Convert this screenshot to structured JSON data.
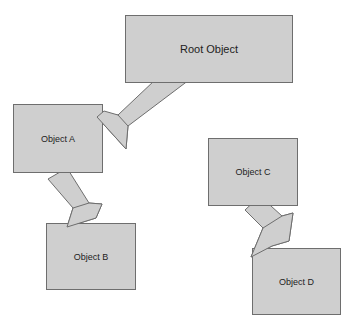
{
  "diagram": {
    "colors": {
      "fill": "#cfcfcf",
      "stroke": "#6e6e6e",
      "text": "#222222"
    },
    "nodes": [
      {
        "id": "root",
        "label": "Root Object"
      },
      {
        "id": "a",
        "label": "Object A"
      },
      {
        "id": "b",
        "label": "Object B"
      },
      {
        "id": "c",
        "label": "Object C"
      },
      {
        "id": "d",
        "label": "Object D"
      }
    ],
    "edges": [
      {
        "from": "Root Object",
        "to": "Object A"
      },
      {
        "from": "Object A",
        "to": "Object B"
      },
      {
        "from": "Object C",
        "to": "Object D"
      }
    ]
  }
}
